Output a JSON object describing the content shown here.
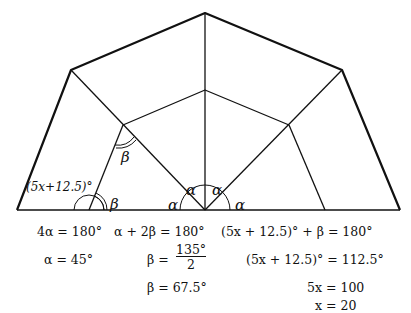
{
  "diagram": {
    "title": "",
    "labels": {
      "alpha": "α",
      "beta": "β",
      "angle_expr": "(5x+12.5)°"
    }
  },
  "equations": {
    "col1": [
      "4α = 180°",
      "α = 45°"
    ],
    "col2": [
      "α + 2β = 180°",
      "β =",
      "135°",
      "2",
      "β = 67.5°"
    ],
    "col3": [
      "(5x + 12.5)° + β = 180°",
      "(5x + 12.5)° = 112.5°",
      "5x = 100",
      "x = 20"
    ]
  }
}
